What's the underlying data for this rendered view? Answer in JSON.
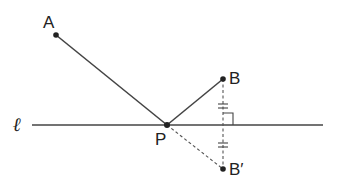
{
  "diagram": {
    "labels": {
      "A": "A",
      "B": "B",
      "B_prime": "B′",
      "P": "P",
      "line": "ℓ"
    },
    "points": {
      "A": [
        56,
        35
      ],
      "P": [
        167,
        125
      ],
      "B": [
        223,
        79
      ],
      "B_prime": [
        223,
        169
      ]
    },
    "line_l": {
      "x1": 32,
      "x2": 323,
      "y": 125
    },
    "colors": {
      "stroke": "#333333",
      "background": "#ffffff"
    }
  }
}
